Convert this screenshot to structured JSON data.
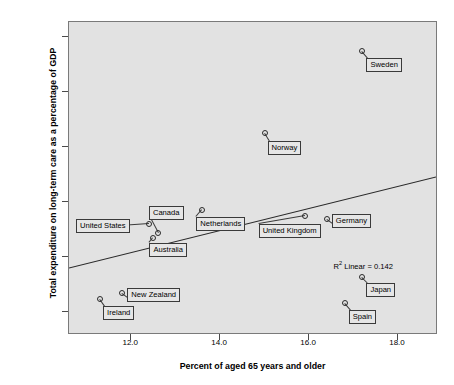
{
  "chart_data": {
    "type": "scatter",
    "title": "",
    "xlabel": "Percent of aged 65 years and older",
    "ylabel": "Total expenditure on long-term care as a percentage of GDP",
    "xlim": [
      10.6,
      18.9
    ],
    "ylim": [
      0.29,
      3.14
    ],
    "xticks": [
      "12.0",
      "14.0",
      "16.0",
      "18.0"
    ],
    "xtick_values": [
      12.0,
      14.0,
      16.0,
      18.0
    ],
    "yticks": [
      "0.50",
      "1.00",
      "1.50",
      "2.00",
      "2.50",
      "3.00"
    ],
    "ytick_values": [
      0.5,
      1.0,
      1.5,
      2.0,
      2.5,
      3.0
    ],
    "grid": false,
    "legend": "none",
    "annotation": "R² Linear = 0.142",
    "annotation_r2": 0.142,
    "fit": {
      "type": "linear",
      "x_start": 10.6,
      "y_start": 0.885,
      "x_end": 18.9,
      "y_end": 1.72
    },
    "points": [
      {
        "label": "Sweden",
        "x": 17.2,
        "y": 2.88
      },
      {
        "label": "Norway",
        "x": 15.0,
        "y": 2.13
      },
      {
        "label": "Netherlands",
        "x": 13.6,
        "y": 1.43
      },
      {
        "label": "United Kingdom",
        "x": 15.9,
        "y": 1.37
      },
      {
        "label": "Germany",
        "x": 16.4,
        "y": 1.35
      },
      {
        "label": "United States",
        "x": 12.4,
        "y": 1.3
      },
      {
        "label": "Canada",
        "x": 12.6,
        "y": 1.22
      },
      {
        "label": "Australia",
        "x": 12.5,
        "y": 1.17
      },
      {
        "label": "Japan",
        "x": 17.2,
        "y": 0.82
      },
      {
        "label": "New Zealand",
        "x": 11.8,
        "y": 0.67
      },
      {
        "label": "Ireland",
        "x": 11.3,
        "y": 0.62
      },
      {
        "label": "Spain",
        "x": 16.8,
        "y": 0.58
      }
    ]
  },
  "colors": {
    "plot_background": "#e2e2e2",
    "page_background": "#ffffff",
    "axis": "#7a7a7a",
    "marker": "#2a2a2a",
    "label_box": "#e6e6e6",
    "label_border": "#3a3a3a",
    "fit_line": "#2a2a2a"
  }
}
